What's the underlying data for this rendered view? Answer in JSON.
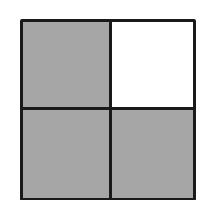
{
  "diagram": {
    "type": "fraction-grid",
    "rows": 2,
    "columns": 2,
    "cells": [
      {
        "position": "top-left",
        "shaded": true
      },
      {
        "position": "top-right",
        "shaded": false
      },
      {
        "position": "bottom-left",
        "shaded": true
      },
      {
        "position": "bottom-right",
        "shaded": true
      }
    ],
    "shaded_count": 3,
    "total_count": 4,
    "colors": {
      "shaded": "#a6a6a6",
      "unshaded": "#ffffff",
      "border": "#1a1a1a"
    }
  }
}
